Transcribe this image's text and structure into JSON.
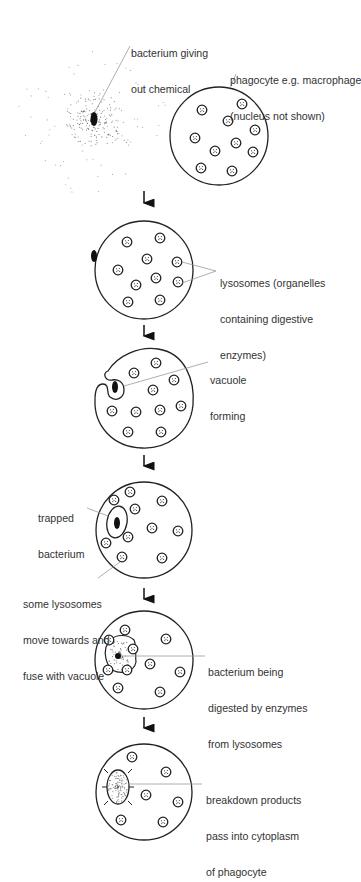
{
  "diagram": {
    "stages": [
      {
        "id": "stage-1",
        "labels": [
          {
            "name": "bacterium-label",
            "lines": [
              "bacterium giving",
              "out chemical"
            ]
          },
          {
            "name": "phagocyte-label",
            "lines": [
              "phagocyte e.g. macrophage",
              "(nucleus not shown)"
            ]
          }
        ]
      },
      {
        "id": "stage-2",
        "labels": [
          {
            "name": "lysosomes-label",
            "lines": [
              "lysosomes (organelles",
              "containing digestive",
              "enzymes)"
            ]
          }
        ]
      },
      {
        "id": "stage-3",
        "labels": [
          {
            "name": "vacuole-forming-label",
            "lines": [
              "vacuole",
              "forming"
            ]
          }
        ]
      },
      {
        "id": "stage-4",
        "labels": [
          {
            "name": "trapped-bacterium-label",
            "lines": [
              "trapped",
              "bacterium"
            ]
          },
          {
            "name": "lysosomes-fuse-label",
            "lines": [
              "some lysosomes",
              "move towards and",
              "fuse with vacuole"
            ]
          }
        ]
      },
      {
        "id": "stage-5",
        "labels": [
          {
            "name": "digestion-label",
            "lines": [
              "bacterium being",
              "digested by enzymes",
              "from lysosomes"
            ]
          }
        ]
      },
      {
        "id": "stage-6",
        "labels": [
          {
            "name": "breakdown-label",
            "lines": [
              "breakdown products",
              "pass into cytoplasm",
              "of phagocyte"
            ]
          }
        ]
      }
    ],
    "colors": {
      "line": "#222222",
      "leader": "#999999",
      "text": "#333333",
      "fill": "#ffffff"
    }
  }
}
